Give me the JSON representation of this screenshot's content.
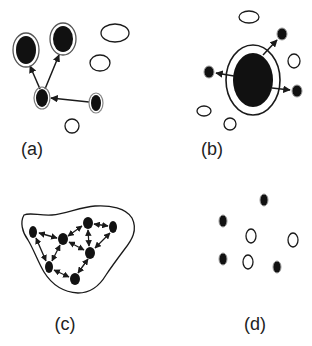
{
  "figure": {
    "panels": [
      {
        "id": "a",
        "label": "(a)",
        "description": "Small network: one node points to two large ringed nodes; another node points to it; several empty ellipses nearby",
        "filled_nodes": [
          {
            "id": "a1",
            "x": 26,
            "y": 50,
            "rx": 10,
            "ry": 14,
            "ring": true
          },
          {
            "id": "a2",
            "x": 63,
            "y": 39,
            "rx": 10,
            "ry": 13,
            "ring": true
          },
          {
            "id": "a3",
            "x": 42,
            "y": 98,
            "rx": 6,
            "ry": 9,
            "ring": true
          },
          {
            "id": "a4",
            "x": 96,
            "y": 103,
            "rx": 5,
            "ry": 8,
            "ring": true
          }
        ],
        "empty_nodes": [
          {
            "x": 115,
            "y": 33,
            "rx": 14,
            "ry": 9
          },
          {
            "x": 100,
            "y": 63,
            "rx": 10,
            "ry": 8
          },
          {
            "x": 72,
            "y": 126,
            "rx": 7,
            "ry": 7
          }
        ],
        "edges": [
          {
            "from": "a3",
            "to": "a1"
          },
          {
            "from": "a3",
            "to": "a2"
          },
          {
            "from": "a4",
            "to": "a3"
          }
        ]
      },
      {
        "id": "b",
        "label": "(b)",
        "description": "Large central node with outer ring, arrows pointing out to three small nodes; empty ellipses scattered",
        "filled_nodes": [
          {
            "id": "b0",
            "x": 253,
            "y": 80,
            "rx": 20,
            "ry": 27,
            "ring": true
          },
          {
            "id": "b1",
            "x": 282,
            "y": 34,
            "rx": 5,
            "ry": 6
          },
          {
            "id": "b2",
            "x": 209,
            "y": 72,
            "rx": 5,
            "ry": 6
          },
          {
            "id": "b3",
            "x": 297,
            "y": 91,
            "rx": 5,
            "ry": 6
          }
        ],
        "empty_nodes": [
          {
            "x": 249,
            "y": 17,
            "rx": 10,
            "ry": 6
          },
          {
            "x": 294,
            "y": 61,
            "rx": 6,
            "ry": 7
          },
          {
            "x": 204,
            "y": 111,
            "rx": 7,
            "ry": 5
          },
          {
            "x": 230,
            "y": 124,
            "rx": 6,
            "ry": 6
          }
        ],
        "edges": [
          {
            "from": "b0",
            "to": "b1"
          },
          {
            "from": "b0",
            "to": "b2"
          },
          {
            "from": "b0",
            "to": "b3"
          }
        ]
      },
      {
        "id": "c",
        "label": "(c)",
        "description": "Densely connected network of filled nodes with bidirectional arrows, enclosed by an irregular boundary",
        "filled_nodes": [
          {
            "id": "c1",
            "x": 33,
            "y": 232,
            "rx": 4,
            "ry": 6
          },
          {
            "id": "c2",
            "x": 63,
            "y": 239,
            "rx": 5,
            "ry": 6
          },
          {
            "id": "c3",
            "x": 88,
            "y": 223,
            "rx": 5,
            "ry": 6
          },
          {
            "id": "c4",
            "x": 113,
            "y": 227,
            "rx": 4,
            "ry": 6
          },
          {
            "id": "c5",
            "x": 90,
            "y": 253,
            "rx": 5,
            "ry": 6
          },
          {
            "id": "c6",
            "x": 49,
            "y": 267,
            "rx": 4,
            "ry": 6
          },
          {
            "id": "c7",
            "x": 75,
            "y": 279,
            "rx": 5,
            "ry": 6
          }
        ],
        "edges": [
          {
            "from": "c2",
            "to": "c1",
            "bidirectional": true
          },
          {
            "from": "c1",
            "to": "c6",
            "bidirectional": true
          },
          {
            "from": "c2",
            "to": "c6",
            "bidirectional": true
          },
          {
            "from": "c2",
            "to": "c3",
            "bidirectional": true
          },
          {
            "from": "c3",
            "to": "c4",
            "bidirectional": true
          },
          {
            "from": "c3",
            "to": "c5",
            "bidirectional": true
          },
          {
            "from": "c2",
            "to": "c5",
            "bidirectional": true
          },
          {
            "from": "c4",
            "to": "c5",
            "bidirectional": true
          },
          {
            "from": "c5",
            "to": "c7",
            "bidirectional": true
          },
          {
            "from": "c6",
            "to": "c7",
            "bidirectional": true
          }
        ]
      },
      {
        "id": "d",
        "label": "(d)",
        "description": "Scattered unconnected filled and empty nodes",
        "filled_nodes": [
          {
            "x": 264,
            "y": 200,
            "rx": 4,
            "ry": 6
          },
          {
            "x": 223,
            "y": 221,
            "rx": 4,
            "ry": 6
          },
          {
            "x": 223,
            "y": 259,
            "rx": 4,
            "ry": 6
          },
          {
            "x": 277,
            "y": 267,
            "rx": 4,
            "ry": 6
          }
        ],
        "empty_nodes": [
          {
            "x": 251,
            "y": 236,
            "rx": 5,
            "ry": 7
          },
          {
            "x": 293,
            "y": 240,
            "rx": 5,
            "ry": 7
          },
          {
            "x": 248,
            "y": 262,
            "rx": 5,
            "ry": 7
          }
        ],
        "edges": []
      }
    ],
    "colors": {
      "node_fill": "#111111",
      "stroke": "#1a1a1a",
      "ring": "#555555",
      "background": "#ffffff"
    }
  }
}
